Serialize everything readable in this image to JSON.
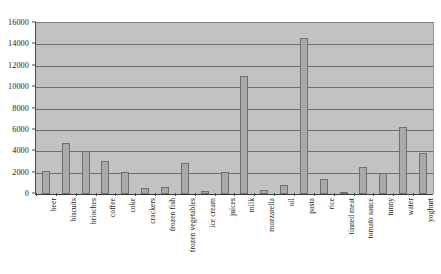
{
  "chart_data": {
    "type": "bar",
    "title": "",
    "subtitle": "",
    "xlabel": "",
    "ylabel": "",
    "ylim": [
      0,
      16000
    ],
    "ytick_step": 2000,
    "ytick_labels": [
      "0",
      "2000",
      "4000",
      "6000",
      "8000",
      "10000",
      "12000",
      "14000",
      "16000"
    ],
    "ytick_values": [
      0,
      2000,
      4000,
      6000,
      8000,
      10000,
      12000,
      14000,
      16000
    ],
    "grid": true,
    "legend": false,
    "legend_position": "none",
    "orientation": "vertical",
    "categories": [
      "beer",
      "biscuits",
      "brioches",
      "coffee",
      "coke",
      "crackers",
      "frozen fish",
      "frozen vegetables",
      "ice cream",
      "juices",
      "milk",
      "mozzarella",
      "oil",
      "pasta",
      "rice",
      "tinned meat",
      "tomato sauce",
      "tunny",
      "water",
      "yoghurt"
    ],
    "values": [
      2200,
      4800,
      4000,
      3100,
      2100,
      600,
      700,
      2900,
      250,
      2100,
      11000,
      400,
      800,
      14600,
      1400,
      150,
      2500,
      2000,
      6300,
      3800
    ],
    "colors": {
      "plot_background": "#c2c2c2",
      "bar_fill": "#a9a9a9",
      "bar_stroke": "#6f6f6f",
      "gridline": "#6e6e6e",
      "axis": "#3b3b3b",
      "text": "#1a1a1a",
      "page_background": "#ffffff"
    }
  }
}
